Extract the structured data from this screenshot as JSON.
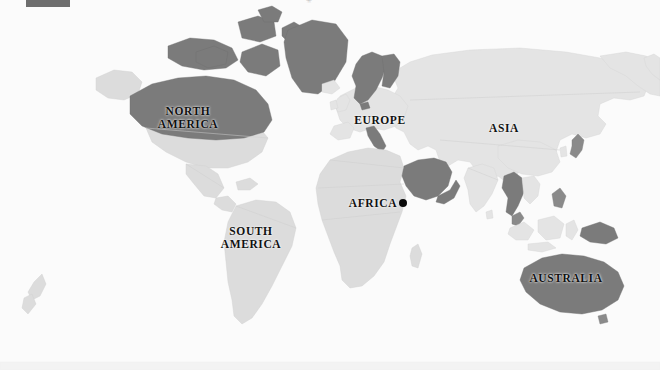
{
  "map": {
    "title": "World Map",
    "projection": "equirectangular",
    "colors": {
      "ocean": "#fbfbfb",
      "land": "#dcdcdc",
      "land_light": "#e4e4e4",
      "highlight": "#7b7b7b",
      "highlight_soft": "#8a8a8a",
      "border": "#cfcfcf",
      "label": "#111111",
      "marker": "#0a0a0a"
    },
    "labels": [
      {
        "id": "north-america",
        "text": "NORTH\nAMERICA",
        "x": 188,
        "y": 112
      },
      {
        "id": "europe",
        "text": "EUROPE",
        "x": 380,
        "y": 116
      },
      {
        "id": "asia",
        "text": "ASIA",
        "x": 504,
        "y": 124
      },
      {
        "id": "africa",
        "text": "AFRICA",
        "x": 376,
        "y": 201
      },
      {
        "id": "south-america",
        "text": "SOUTH\nAMERICA",
        "x": 251,
        "y": 231
      },
      {
        "id": "australia",
        "text": "AUSTRALIA",
        "x": 566,
        "y": 276
      }
    ],
    "marker": {
      "id": "site-marker",
      "label": "",
      "x": 403,
      "y": 203
    },
    "legend": {
      "swatch_color": "#6e6e6e",
      "caption": "",
      "mark": "✳"
    },
    "highlighted_regions": [
      "Canada",
      "Greenland",
      "Norway",
      "Sweden",
      "Finland",
      "Italy",
      "Saudi Arabia",
      "Yemen",
      "Oman",
      "Myanmar",
      "Thailand",
      "Malaysia",
      "Papua New Guinea",
      "Australia",
      "Japan"
    ]
  }
}
